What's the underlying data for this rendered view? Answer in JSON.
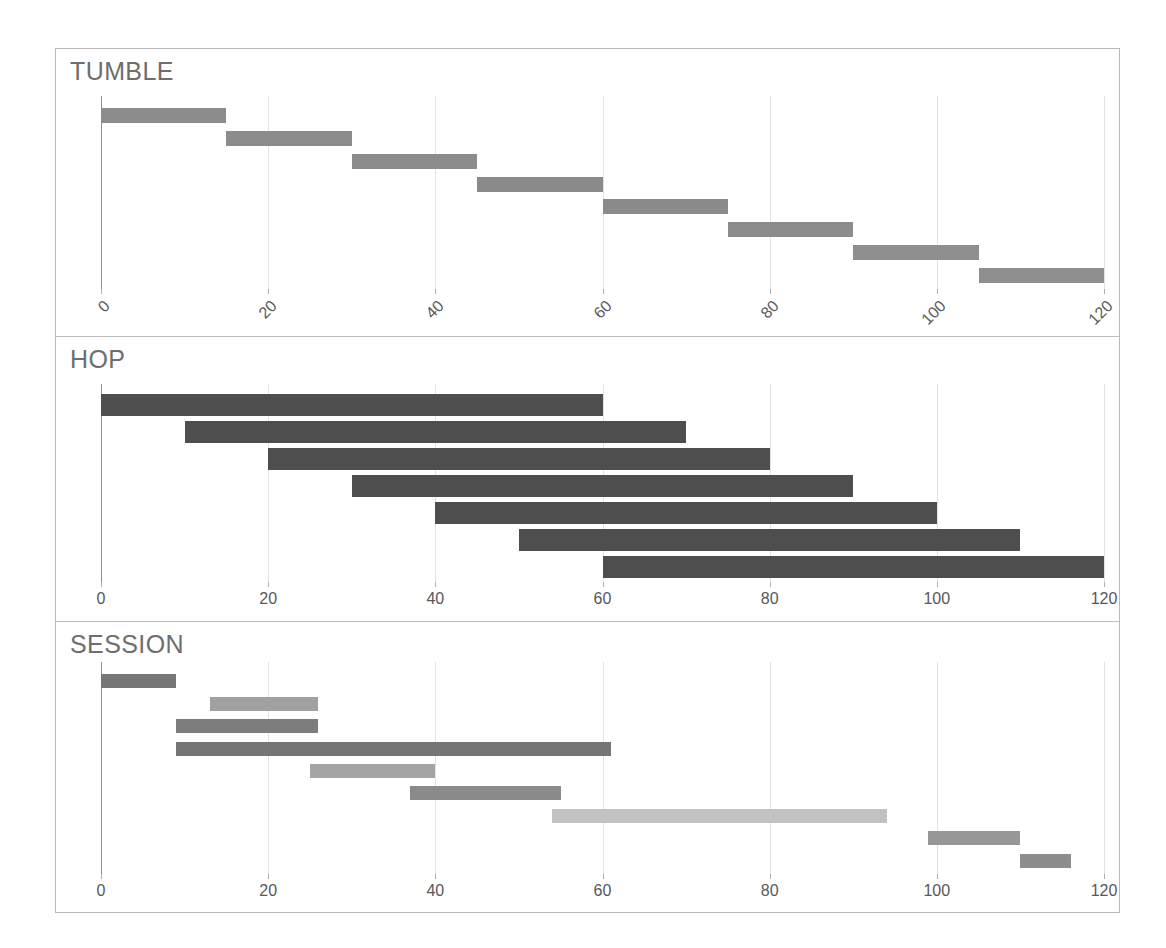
{
  "figure": {
    "background_color": "#ffffff",
    "frame_color": "#b9b9b9",
    "divider_color": "#bdbdbd"
  },
  "axis": {
    "ticks": [
      0,
      20,
      40,
      60,
      80,
      100,
      120
    ],
    "tick_labels": [
      "0",
      "20",
      "40",
      "60",
      "80",
      "100",
      "120"
    ],
    "xmin": 0,
    "xmax": 120,
    "gridline_color": "#e2e2e2",
    "axis_color": "#909090",
    "tick_label_color": "#585858"
  },
  "panels": [
    {
      "id": "tumble",
      "title": "TUMBLE",
      "tick_rotation": "-45"
    },
    {
      "id": "hop",
      "title": "HOP",
      "tick_rotation": "0"
    },
    {
      "id": "session",
      "title": "SESSION",
      "tick_rotation": "0"
    }
  ],
  "chart_data": [
    {
      "type": "bar",
      "orientation": "horizontal-ranges",
      "title": "TUMBLE",
      "xlabel": "",
      "ylabel": "",
      "xlim": [
        0,
        120
      ],
      "xticks": [
        0,
        20,
        40,
        60,
        80,
        100,
        120
      ],
      "grid": true,
      "legend": "none",
      "window_kind": "tumbling",
      "window_size": 15,
      "window_slide": 15,
      "bars": [
        {
          "start": 0,
          "end": 15,
          "color": "#8c8c8c"
        },
        {
          "start": 15,
          "end": 30,
          "color": "#8c8c8c"
        },
        {
          "start": 30,
          "end": 45,
          "color": "#8c8c8c"
        },
        {
          "start": 45,
          "end": 60,
          "color": "#8a8a8a"
        },
        {
          "start": 60,
          "end": 75,
          "color": "#8a8a8a"
        },
        {
          "start": 75,
          "end": 90,
          "color": "#8c8c8c"
        },
        {
          "start": 90,
          "end": 105,
          "color": "#8f8f8f"
        },
        {
          "start": 105,
          "end": 120,
          "color": "#8f8f8f"
        }
      ]
    },
    {
      "type": "bar",
      "orientation": "horizontal-ranges",
      "title": "HOP",
      "xlabel": "",
      "ylabel": "",
      "xlim": [
        0,
        120
      ],
      "xticks": [
        0,
        20,
        40,
        60,
        80,
        100,
        120
      ],
      "grid": true,
      "legend": "none",
      "window_kind": "hopping",
      "window_size": 60,
      "window_slide": 10,
      "bars": [
        {
          "start": 0,
          "end": 60,
          "color": "#4e4e4e"
        },
        {
          "start": 10,
          "end": 70,
          "color": "#4e4e4e"
        },
        {
          "start": 20,
          "end": 80,
          "color": "#4e4e4e"
        },
        {
          "start": 30,
          "end": 90,
          "color": "#4e4e4e"
        },
        {
          "start": 40,
          "end": 100,
          "color": "#4e4e4e"
        },
        {
          "start": 50,
          "end": 110,
          "color": "#4e4e4e"
        },
        {
          "start": 60,
          "end": 120,
          "color": "#4e4e4e"
        }
      ]
    },
    {
      "type": "bar",
      "orientation": "horizontal-ranges",
      "title": "SESSION",
      "xlabel": "",
      "ylabel": "",
      "xlim": [
        0,
        120
      ],
      "xticks": [
        0,
        20,
        40,
        60,
        80,
        100,
        120
      ],
      "grid": true,
      "legend": "none",
      "window_kind": "session",
      "bars": [
        {
          "start": 0,
          "end": 9,
          "color": "#777777"
        },
        {
          "start": 13,
          "end": 26,
          "color": "#a0a0a0"
        },
        {
          "start": 9,
          "end": 26,
          "color": "#7d7d7d"
        },
        {
          "start": 9,
          "end": 61,
          "color": "#757575"
        },
        {
          "start": 25,
          "end": 40,
          "color": "#a4a4a4"
        },
        {
          "start": 37,
          "end": 55,
          "color": "#8a8a8a"
        },
        {
          "start": 54,
          "end": 94,
          "color": "#c2c2c2"
        },
        {
          "start": 99,
          "end": 110,
          "color": "#979797"
        },
        {
          "start": 110,
          "end": 116,
          "color": "#8d8d8d"
        }
      ]
    }
  ]
}
